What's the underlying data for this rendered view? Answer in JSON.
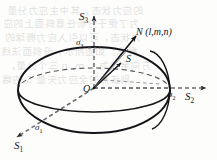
{
  "figure": {
    "kind": "stress-ellipsoid-diagram",
    "stroke_color": "#141418",
    "dash_color": "#6d6d74",
    "background": "#fdfdfb"
  },
  "labels": {
    "axis_s3": {
      "base": "S",
      "sub": "3"
    },
    "axis_s2": {
      "base": "S",
      "sub": "2"
    },
    "axis_s1": {
      "base": "S",
      "sub": "1"
    },
    "sigma_3": {
      "base": "σ",
      "sub": "3"
    },
    "sigma_2": {
      "base": "σ",
      "sub": "2"
    },
    "sigma_1": {
      "base": "σ",
      "sub": "1"
    },
    "origin": "O",
    "normal_vector": {
      "base": "N",
      "args": "(l,m,n)"
    },
    "stress_vector": "S"
  },
  "geometry": {
    "origin_px": [
      94,
      88
    ],
    "ellipsoid_center_px": [
      94,
      90
    ],
    "equator_rx": 76,
    "equator_ry": 22,
    "meridian_rx": 76,
    "meridian_ry": 43,
    "s3_axis_tip_px": [
      94,
      12
    ],
    "s2_axis_tip_px": [
      210,
      88
    ],
    "s1_axis_tip_px": [
      12,
      140
    ],
    "normal_tip_px": [
      138,
      34
    ],
    "stress_tip_px": [
      124,
      62
    ]
  },
  "bleed_text": [
    "的应力状态，其中主应力分量",
    "为了便于分析任意斜面上的应",
    "力状态，可以引入应力椭球的",
    "概念。如图所示，设斜面法线",
    "方向余弦为 l, m, n 三个分量，",
    "则该点的全应力矢量 S 的端"
  ]
}
